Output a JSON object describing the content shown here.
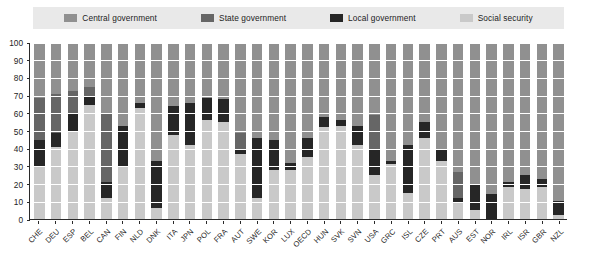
{
  "chart_data": {
    "type": "bar",
    "subtype": "stacked-bar-100",
    "title": "",
    "xlabel": "",
    "ylabel": "",
    "ylim": [
      0,
      100
    ],
    "ytick_labels": [
      "0",
      "10",
      "20",
      "30",
      "40",
      "50",
      "60",
      "70",
      "80",
      "90",
      "100"
    ],
    "ytick_values": [
      0,
      10,
      20,
      30,
      40,
      50,
      60,
      70,
      80,
      90,
      100
    ],
    "grid": true,
    "legend_position": "top",
    "legend": [
      {
        "name": "Central government",
        "color": "#909090"
      },
      {
        "name": "State government",
        "color": "#666666"
      },
      {
        "name": "Local government",
        "color": "#262626"
      },
      {
        "name": "Social security",
        "color": "#c9c9c9"
      }
    ],
    "categories": [
      "CHE",
      "DEU",
      "ESP",
      "BEL",
      "CAN",
      "FIN",
      "NLD",
      "DNK",
      "ITA",
      "JPN",
      "POL",
      "FRA",
      "AUT",
      "SWE",
      "KOR",
      "LUX",
      "OECD",
      "HUN",
      "SVK",
      "SVN",
      "USA",
      "GRC",
      "ISL",
      "CZE",
      "PRT",
      "AUS",
      "EST",
      "NOR",
      "IRL",
      "ISR",
      "GBR",
      "NZL"
    ],
    "series": [
      {
        "name": "Central government",
        "color": "#909090",
        "values": [
          31,
          29,
          27,
          25,
          40,
          47,
          34,
          67,
          36,
          34,
          31,
          32,
          51,
          54,
          55,
          68,
          54,
          42,
          44,
          47,
          41,
          67,
          58,
          45,
          60,
          73,
          80,
          86,
          79,
          75,
          77,
          90
        ]
      },
      {
        "name": "State government",
        "color": "#666666",
        "values": [
          24,
          22,
          13,
          5,
          39,
          0,
          0,
          0,
          0,
          0,
          0,
          0,
          9,
          0,
          0,
          0,
          0,
          0,
          0,
          0,
          20,
          0,
          0,
          0,
          0,
          15,
          0,
          0,
          0,
          0,
          0,
          0
        ]
      },
      {
        "name": "Local government",
        "color": "#262626",
        "values": [
          15,
          8,
          10,
          5,
          9,
          23,
          3,
          27,
          16,
          24,
          13,
          13,
          3,
          34,
          17,
          4,
          11,
          6,
          3,
          11,
          14,
          2,
          27,
          9,
          7,
          3,
          15,
          14,
          3,
          8,
          5,
          8
        ]
      },
      {
        "name": "Social security",
        "color": "#c9c9c9",
        "values": [
          30,
          41,
          50,
          65,
          12,
          30,
          63,
          6,
          48,
          42,
          56,
          55,
          37,
          12,
          28,
          28,
          35,
          52,
          53,
          42,
          25,
          31,
          15,
          46,
          33,
          9,
          5,
          0,
          18,
          17,
          18,
          2
        ]
      }
    ]
  },
  "legend": {
    "items": [
      {
        "label": "Central government",
        "swatch": "legend-swatch-central"
      },
      {
        "label": "State government",
        "swatch": "legend-swatch-state"
      },
      {
        "label": "Local government",
        "swatch": "legend-swatch-local"
      },
      {
        "label": "Social security",
        "swatch": "legend-swatch-social"
      }
    ]
  },
  "colors": {
    "central": "#909090",
    "state": "#666666",
    "local": "#262626",
    "social": "#c9c9c9",
    "legend_background": "#e9e9e9",
    "axis": "#2a2a2a",
    "gridline": "#ffffff",
    "plot_background": "#ffffff"
  }
}
